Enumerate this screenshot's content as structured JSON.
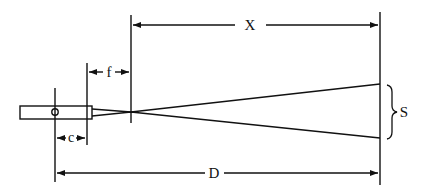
{
  "diagram": {
    "type": "laser beam focusing geometry",
    "labels": {
      "X": "X",
      "f": "f",
      "c": "c",
      "D": "D",
      "S": "S"
    },
    "colors": {
      "ink": "#111111",
      "background": "#ffffff"
    }
  }
}
